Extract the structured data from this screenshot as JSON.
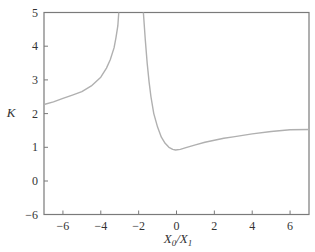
{
  "chart_data": {
    "type": "line",
    "title": "",
    "xlabel": "X0/X1",
    "xlabel_parts": {
      "main": "X",
      "sub0": "0",
      "sep": "/",
      "main2": "X",
      "sub1": "1"
    },
    "ylabel": "K",
    "xlim": [
      -7,
      7
    ],
    "ylim": [
      -6,
      5
    ],
    "y_axis_break": "compressed between -6 and 0",
    "grid": false,
    "legend": null,
    "x_ticks": [
      -6,
      -4,
      -2,
      0,
      2,
      4,
      6
    ],
    "x_tick_labels": [
      "−6",
      "−4",
      "−2",
      "0",
      "2",
      "4",
      "6"
    ],
    "y_ticks": [
      -6,
      0,
      1,
      2,
      3,
      4,
      5
    ],
    "y_tick_labels": [
      "−6",
      "0",
      "1",
      "2",
      "3",
      "4",
      "5"
    ],
    "series": [
      {
        "name": "K (left branch)",
        "color": "#b0b0b0",
        "x": [
          -7,
          -6.5,
          -6,
          -5.5,
          -5,
          -4.5,
          -4,
          -3.7,
          -3.5,
          -3.3,
          -3.2,
          -3.1,
          -3.05
        ],
        "y": [
          2.27,
          2.35,
          2.45,
          2.55,
          2.65,
          2.82,
          3.08,
          3.35,
          3.6,
          3.95,
          4.25,
          4.6,
          5.0
        ]
      },
      {
        "name": "K (right branch)",
        "color": "#b0b0b0",
        "x": [
          -1.75,
          -1.65,
          -1.55,
          -1.45,
          -1.35,
          -1.2,
          -1.0,
          -0.8,
          -0.6,
          -0.4,
          -0.2,
          -0.05,
          0.2,
          0.5,
          1.0,
          1.5,
          2.0,
          2.5,
          3.0,
          4.0,
          5.0,
          6.0,
          7.0
        ],
        "y": [
          5.0,
          4.2,
          3.5,
          2.95,
          2.5,
          2.0,
          1.6,
          1.3,
          1.12,
          1.0,
          0.94,
          0.92,
          0.94,
          0.99,
          1.07,
          1.15,
          1.21,
          1.27,
          1.31,
          1.4,
          1.47,
          1.52,
          1.53
        ]
      }
    ]
  },
  "colors": {
    "axis": "#7a7a7a",
    "curve": "#b0b0b0",
    "text": "#333333"
  }
}
